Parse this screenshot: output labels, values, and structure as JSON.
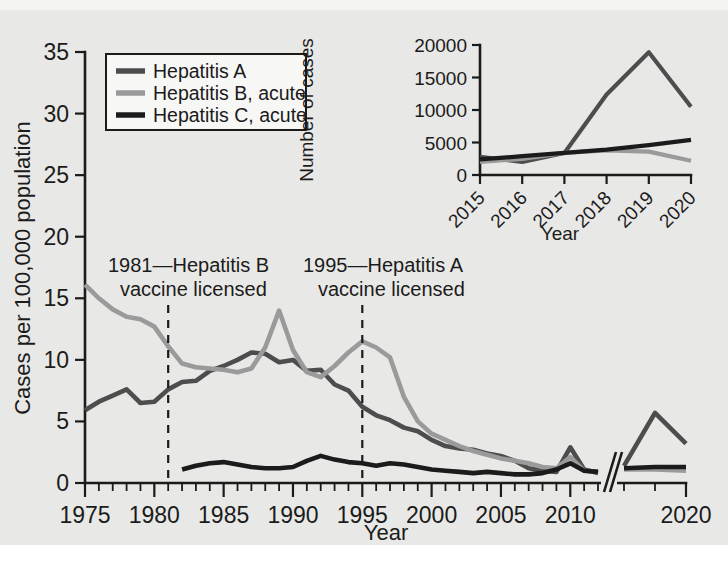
{
  "chart_data": [
    {
      "id": "main",
      "type": "line",
      "title": "",
      "xlabel": "Year",
      "ylabel": "Cases per 100,000 population",
      "xlim": [
        1975,
        2020
      ],
      "ylim": [
        0,
        35
      ],
      "yticks": [
        0,
        5,
        10,
        15,
        20,
        25,
        30,
        35
      ],
      "xticks": [
        1975,
        1980,
        1985,
        1990,
        1995,
        2000,
        2005,
        2010,
        2020
      ],
      "xtick_labels": [
        "1975",
        "1980",
        "1985",
        "1990",
        "1995",
        "2000",
        "2005",
        "2010",
        "2020"
      ],
      "minor_xtick_interval": 1,
      "axis_break": {
        "present": true,
        "between": [
          2012,
          2018
        ],
        "style": "double-slash"
      },
      "grid": false,
      "legend_position": "top-left",
      "series": [
        {
          "name": "Hepatitis A",
          "color": "#4d4d4d",
          "x": [
            1975,
            1976,
            1977,
            1978,
            1979,
            1980,
            1981,
            1982,
            1983,
            1984,
            1985,
            1986,
            1987,
            1988,
            1989,
            1990,
            1991,
            1992,
            1993,
            1994,
            1995,
            1996,
            1997,
            1998,
            1999,
            2000,
            2001,
            2002,
            2003,
            2004,
            2005,
            2006,
            2007,
            2008,
            2009,
            2010,
            2011,
            2012,
            2018,
            2019,
            2020
          ],
          "values": [
            5.9,
            6.6,
            7.1,
            7.6,
            6.5,
            6.6,
            7.6,
            8.2,
            8.3,
            9.1,
            9.5,
            10.0,
            10.6,
            10.5,
            9.8,
            10.0,
            9.1,
            9.2,
            8.0,
            7.5,
            6.2,
            5.5,
            5.1,
            4.5,
            4.2,
            3.5,
            3.0,
            2.8,
            2.7,
            2.4,
            2.2,
            1.8,
            1.2,
            1.0,
            0.9,
            2.9,
            1.1,
            0.8,
            1.4,
            5.7,
            3.2
          ]
        },
        {
          "name": "Hepatitis B, acute",
          "color": "#9a9a9a",
          "x": [
            1975,
            1976,
            1977,
            1978,
            1979,
            1980,
            1981,
            1982,
            1983,
            1984,
            1985,
            1986,
            1987,
            1988,
            1989,
            1990,
            1991,
            1992,
            1993,
            1994,
            1995,
            1996,
            1997,
            1998,
            1999,
            2000,
            2001,
            2002,
            2003,
            2004,
            2005,
            2006,
            2007,
            2008,
            2009,
            2010,
            2011,
            2012,
            2018,
            2019,
            2020
          ],
          "values": [
            16.1,
            15.0,
            14.1,
            13.5,
            13.3,
            12.7,
            11.1,
            9.7,
            9.4,
            9.3,
            9.2,
            9.0,
            9.3,
            11.0,
            14.0,
            10.8,
            9.0,
            8.6,
            9.5,
            10.6,
            11.5,
            11.0,
            10.2,
            7.0,
            5.0,
            4.0,
            3.5,
            3.0,
            2.6,
            2.3,
            2.0,
            1.8,
            1.6,
            1.3,
            1.2,
            2.1,
            1.0,
            0.9,
            1.1,
            1.1,
            1.0
          ]
        },
        {
          "name": "Hepatitis C, acute",
          "color": "#1b1b1b",
          "x": [
            1982,
            1983,
            1984,
            1985,
            1986,
            1987,
            1988,
            1989,
            1990,
            1991,
            1992,
            1993,
            1994,
            1995,
            1996,
            1997,
            1998,
            1999,
            2000,
            2001,
            2002,
            2003,
            2004,
            2005,
            2006,
            2007,
            2008,
            2009,
            2010,
            2011,
            2012,
            2018,
            2019,
            2020
          ],
          "values": [
            1.1,
            1.4,
            1.6,
            1.7,
            1.5,
            1.3,
            1.2,
            1.2,
            1.3,
            1.8,
            2.2,
            1.9,
            1.7,
            1.6,
            1.4,
            1.6,
            1.5,
            1.3,
            1.1,
            1.0,
            0.9,
            0.8,
            0.9,
            0.8,
            0.7,
            0.7,
            0.8,
            1.1,
            1.6,
            1.0,
            0.9,
            1.2,
            1.3,
            1.3
          ]
        }
      ],
      "annotations": [
        {
          "id": "hepb-vaccine",
          "year": 1981,
          "line1": "1981—Hepatitis B",
          "line2": "vaccine licensed"
        },
        {
          "id": "hepa-vaccine",
          "year": 1995,
          "line1": "1995—Hepatitis A",
          "line2": "vaccine licensed"
        }
      ]
    },
    {
      "id": "inset",
      "type": "line",
      "title": "",
      "xlabel": "Year",
      "ylabel": "Number of cases",
      "xlim": [
        2015,
        2020
      ],
      "ylim": [
        0,
        20000
      ],
      "yticks": [
        0,
        5000,
        10000,
        15000,
        20000
      ],
      "ytick_labels": [
        "0",
        "5000",
        "10000",
        "15000",
        "20000"
      ],
      "xticks": [
        2015,
        2016,
        2017,
        2018,
        2019,
        2020
      ],
      "xtick_labels": [
        "2015",
        "2016",
        "2017",
        "2018",
        "2019",
        "2020"
      ],
      "xtick_rotation_deg": 45,
      "grid": false,
      "legend_position": "none",
      "series": [
        {
          "name": "Hepatitis A",
          "color": "#4d4d4d",
          "x": [
            2015,
            2016,
            2017,
            2018,
            2019,
            2020
          ],
          "values": [
            2800,
            2000,
            3400,
            12400,
            18900,
            10500
          ]
        },
        {
          "name": "Hepatitis B, acute",
          "color": "#9a9a9a",
          "x": [
            2015,
            2016,
            2017,
            2018,
            2019,
            2020
          ],
          "values": [
            2000,
            2500,
            3400,
            3800,
            3600,
            2200
          ]
        },
        {
          "name": "Hepatitis C, acute",
          "color": "#1b1b1b",
          "x": [
            2015,
            2016,
            2017,
            2018,
            2019,
            2020
          ],
          "values": [
            2400,
            2900,
            3400,
            3900,
            4600,
            5400
          ]
        }
      ]
    }
  ],
  "legend": {
    "items": [
      {
        "label": "Hepatitis A",
        "color": "#4d4d4d"
      },
      {
        "label": "Hepatitis B, acute",
        "color": "#9a9a9a"
      },
      {
        "label": "Hepatitis C, acute",
        "color": "#1b1b1b"
      }
    ]
  },
  "colors": {
    "background": "#e8e8e6",
    "axis": "#1b1b1b",
    "hepatitis_a": "#4d4d4d",
    "hepatitis_b": "#9a9a9a",
    "hepatitis_c": "#1b1b1b"
  }
}
